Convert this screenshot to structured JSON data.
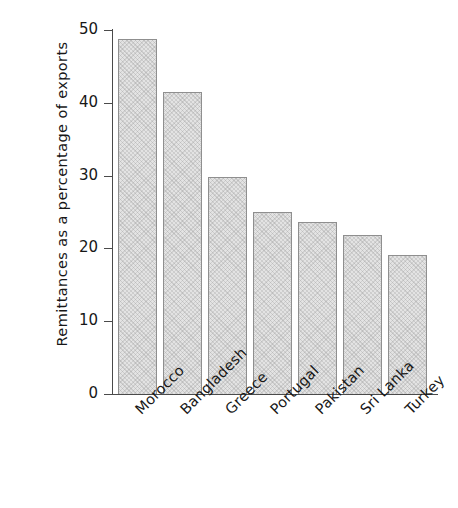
{
  "chart_data": {
    "type": "bar",
    "title": "",
    "xlabel": "",
    "ylabel": "Remittances as a percentage of exports",
    "categories": [
      "Morocco",
      "Bangladesh",
      "Greece",
      "Portugal",
      "Pakistan",
      "Sri Lanka",
      "Turkey"
    ],
    "values": [
      48.8,
      41.5,
      29.8,
      25.0,
      23.6,
      21.9,
      19.1
    ],
    "ylim": [
      0,
      50
    ],
    "yticks": [
      0,
      10,
      20,
      30,
      40,
      50
    ],
    "ytick_labels": [
      "0",
      "10",
      "20",
      "30",
      "40",
      "50"
    ],
    "grid": false,
    "legend": false,
    "bar_fill_color": "#e3e3e3",
    "bar_edge_color": "#8f8f8f",
    "axis_color": "#4a4a4a",
    "text_color": "#171717",
    "background_color": "#ffffff"
  }
}
